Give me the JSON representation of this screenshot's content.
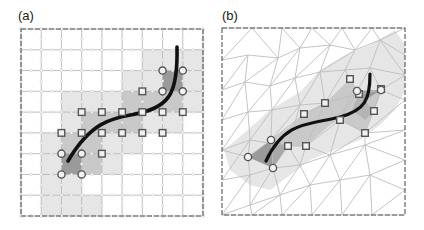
{
  "figure": {
    "panels": [
      {
        "id": "a",
        "label": "(a)",
        "mesh_type": "structured-quad-grid",
        "grid": {
          "cols": 9,
          "rows": 9,
          "x0": 21,
          "y0": 29,
          "x1": 203,
          "y1": 216
        },
        "shaded_light": [
          [
            1,
            6
          ],
          [
            2,
            6
          ],
          [
            1,
            7
          ],
          [
            2,
            7
          ],
          [
            1,
            8
          ],
          [
            2,
            8
          ],
          [
            3,
            8
          ],
          [
            1,
            5
          ],
          [
            2,
            4
          ],
          [
            3,
            3
          ],
          [
            4,
            3
          ],
          [
            5,
            3
          ],
          [
            6,
            2
          ],
          [
            7,
            1
          ],
          [
            8,
            1
          ],
          [
            6,
            1
          ],
          [
            8,
            2
          ],
          [
            8,
            3
          ],
          [
            4,
            6
          ],
          [
            3,
            6
          ],
          [
            4,
            5
          ],
          [
            5,
            5
          ],
          [
            6,
            4
          ],
          [
            7,
            4
          ],
          [
            5,
            2
          ],
          [
            2,
            3
          ]
        ],
        "shaded_mid": [
          [
            2,
            5
          ],
          [
            3,
            5
          ],
          [
            3,
            4
          ],
          [
            4,
            4
          ],
          [
            5,
            4
          ],
          [
            6,
            3
          ],
          [
            7,
            3
          ],
          [
            4,
            4
          ],
          [
            5,
            3
          ],
          [
            6,
            3
          ],
          [
            7,
            2
          ],
          [
            2,
            6
          ],
          [
            3,
            6
          ],
          [
            3,
            5
          ],
          [
            2,
            5
          ]
        ],
        "shaded_dark": [
          [
            2,
            6
          ],
          [
            7,
            2
          ]
        ],
        "circle_nodes": [
          [
            2,
            6
          ],
          [
            3,
            6
          ],
          [
            2,
            7
          ],
          [
            3,
            7
          ],
          [
            7,
            2
          ],
          [
            8,
            2
          ],
          [
            7,
            3
          ],
          [
            8,
            3
          ]
        ],
        "square_nodes": [
          [
            3,
            4
          ],
          [
            4,
            4
          ],
          [
            5,
            4
          ],
          [
            6,
            4
          ],
          [
            7,
            4
          ],
          [
            8,
            4
          ],
          [
            2,
            5
          ],
          [
            3,
            5
          ],
          [
            4,
            5
          ],
          [
            5,
            5
          ],
          [
            6,
            5
          ],
          [
            7,
            5
          ],
          [
            4,
            6
          ],
          [
            6,
            3
          ]
        ],
        "curve": "M 68 161 C 95 115, 120 118, 140 113 C 170 106, 178 92, 177 47"
      },
      {
        "id": "b",
        "label": "(b)",
        "mesh_type": "unstructured-triangular-mesh",
        "box": {
          "x0": 222,
          "y0": 28,
          "x1": 405,
          "y1": 215
        },
        "circle_nodes": [
          [
            248,
            157
          ],
          [
            271,
            140
          ],
          [
            273,
            168
          ],
          [
            357,
            91
          ],
          [
            381,
            90
          ]
        ],
        "square_nodes": [
          [
            288,
            146
          ],
          [
            306,
            146
          ],
          [
            304,
            114
          ],
          [
            325,
            103
          ],
          [
            350,
            79
          ],
          [
            359,
            94
          ],
          [
            381,
            89
          ],
          [
            374,
            111
          ],
          [
            365,
            133
          ],
          [
            340,
            120
          ]
        ],
        "curve": "M 266 161 C 285 120, 310 125, 340 117 C 365 110, 370 100, 370 74"
      }
    ],
    "legend": {
      "circle": "boundary-node",
      "square": "interface-node"
    },
    "colors": {
      "grid_line": "#b9b9b9",
      "grid_node": "#c9c9c9",
      "border_dash": "#555555",
      "shade_light": "#e6e6e6",
      "shade_mid": "#c9c9c9",
      "shade_dark": "#9a9a9a",
      "curve": "#111111",
      "marker_stroke": "#555555"
    }
  }
}
